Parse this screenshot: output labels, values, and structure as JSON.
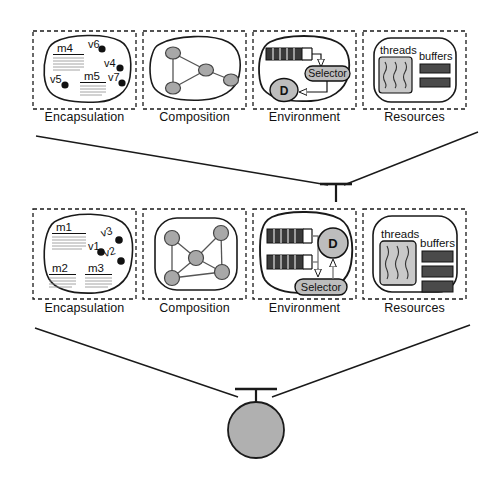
{
  "diagram": {
    "colors": {
      "line": "#1a1a1a",
      "dashed_border": "#1a1a1a",
      "node_fill": "#a8a8a8",
      "dark_fill": "#3a3a3a",
      "light_fill": "#c9c9c9",
      "circle_fill": "#b0b0b0",
      "background": "#ffffff"
    },
    "panel_labels": [
      "Encapsulation",
      "Composition",
      "Environment",
      "Resources"
    ],
    "rows": [
      {
        "id": "upper-row",
        "encapsulation": {
          "label": "Encapsulation",
          "methods": [
            "m4",
            "m5"
          ],
          "variables": [
            "v6",
            "v4",
            "v5",
            "v7"
          ]
        },
        "composition": {
          "label": "Composition",
          "node_count": 4,
          "edge_count": 4
        },
        "environment": {
          "label": "Environment",
          "queue_count": 1,
          "selector_label": "Selector",
          "dispatcher_label": "D"
        },
        "resources": {
          "label": "Resources",
          "threads_label": "threads",
          "buffers_label": "buffers",
          "thread_count": 3,
          "buffer_count": 2
        }
      },
      {
        "id": "lower-row",
        "encapsulation": {
          "label": "Encapsulation",
          "methods": [
            "m1",
            "m2",
            "m3"
          ],
          "variables": [
            "v1",
            "v3",
            "v2"
          ]
        },
        "composition": {
          "label": "Composition",
          "node_count": 5,
          "edge_count": 6
        },
        "environment": {
          "label": "Environment",
          "queue_count": 2,
          "selector_label": "Selector",
          "dispatcher_label": "D"
        },
        "resources": {
          "label": "Resources",
          "threads_label": "threads",
          "buffers_label": "buffers",
          "thread_count": 3,
          "buffer_count": 3
        }
      }
    ],
    "connectors": [
      {
        "name": "upper-to-lower",
        "shape": "v-converging-lines-to-t-bar"
      },
      {
        "name": "lower-to-actor",
        "shape": "v-converging-lines-to-t-bar"
      }
    ],
    "actor_node": {
      "name": "actor-circle",
      "shape": "filled-circle"
    }
  }
}
